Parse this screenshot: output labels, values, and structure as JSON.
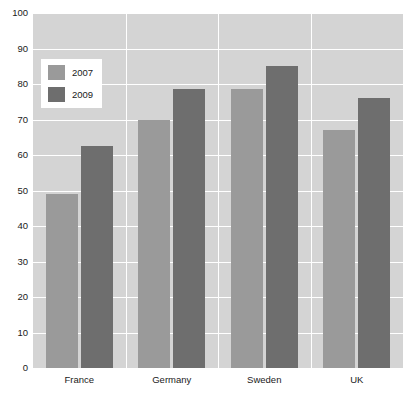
{
  "chart_data": {
    "type": "bar",
    "title": "",
    "xlabel": "",
    "ylabel": "",
    "categories": [
      "France",
      "Germany",
      "Sweden",
      "UK"
    ],
    "series": [
      {
        "name": "2007",
        "color": "#9a9a9a",
        "values": [
          49,
          70,
          78.5,
          67
        ]
      },
      {
        "name": "2009",
        "color": "#6e6e6e",
        "values": [
          62.5,
          78.5,
          85,
          76
        ]
      }
    ],
    "ylim": [
      0,
      100
    ],
    "ytick_step": 10,
    "yticks": [
      "100",
      "90",
      "80",
      "70",
      "60",
      "50",
      "40",
      "30",
      "20",
      "10",
      "0"
    ],
    "grid": true,
    "grid_color": "#ffffff",
    "plot_background": "#d4d4d4",
    "legend_position": "top-left",
    "legend_entries": [
      "2007",
      "2009"
    ]
  }
}
